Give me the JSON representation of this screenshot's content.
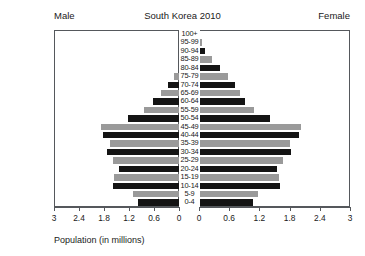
{
  "header": {
    "male_label": "Male",
    "title": "South Korea 2010",
    "female_label": "Female"
  },
  "axis": {
    "title": "Population (in millions)",
    "ticks_left": [
      "3",
      "2.4",
      "1.8",
      "1.2",
      "0.6",
      "0"
    ],
    "ticks_right": [
      "0",
      "0.6",
      "1.2",
      "1.8",
      "2.4",
      "3"
    ],
    "max": 3,
    "step": 0.6
  },
  "colors": {
    "dark_bar": "#141414",
    "gray_bar": "#9a9a9a",
    "frame": "#55585c",
    "background": "#ffffff"
  },
  "chart_data": {
    "type": "bar",
    "title": "South Korea 2010",
    "subtype": "population-pyramid",
    "xlabel": "Population (in millions)",
    "ylabel": "",
    "xlim": [
      0,
      3
    ],
    "grid": false,
    "legend": "none",
    "categories": [
      "100+",
      "95-99",
      "90-94",
      "85-89",
      "80-84",
      "75-79",
      "70-74",
      "65-69",
      "60-64",
      "55-59",
      "50-54",
      "45-49",
      "40-44",
      "35-39",
      "30-34",
      "25-29",
      "20-24",
      "15-19",
      "10-14",
      "5-9",
      "0-4"
    ],
    "series": [
      {
        "name": "Male",
        "side": "left",
        "values": [
          0.0,
          0.01,
          0.03,
          0.08,
          0.17,
          0.3,
          0.44,
          0.61,
          0.79,
          1.02,
          1.39,
          2.03,
          2.0,
          1.83,
          1.9,
          1.76,
          1.62,
          1.73,
          1.75,
          1.27,
          1.15
        ]
      },
      {
        "name": "Female",
        "side": "right",
        "values": [
          0.0,
          0.03,
          0.1,
          0.23,
          0.4,
          0.55,
          0.7,
          0.79,
          0.9,
          1.08,
          1.4,
          2.0,
          1.97,
          1.78,
          1.81,
          1.64,
          1.52,
          1.56,
          1.58,
          1.15,
          1.05
        ]
      }
    ],
    "bar_styles": [
      "dark",
      "gray",
      "dark",
      "gray",
      "dark",
      "gray",
      "dark",
      "gray",
      "dark",
      "gray",
      "dark",
      "gray",
      "dark",
      "gray",
      "dark",
      "gray",
      "dark",
      "gray",
      "dark",
      "gray",
      "dark"
    ]
  }
}
